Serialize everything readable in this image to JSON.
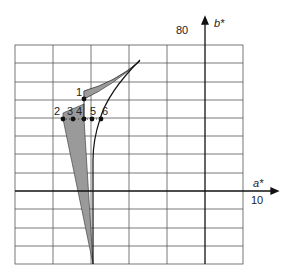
{
  "diagram": {
    "type": "CIELAB a*-b* chromaticity grid with shaded regions",
    "axes": {
      "x_label": "a*",
      "y_label": "b*",
      "x_tick_label": "10",
      "y_tick_label": "80"
    },
    "points": [
      {
        "id": "1",
        "label": "1"
      },
      {
        "id": "2",
        "label": "2"
      },
      {
        "id": "3",
        "label": "3"
      },
      {
        "id": "4",
        "label": "4"
      },
      {
        "id": "5",
        "label": "5"
      },
      {
        "id": "6",
        "label": "6"
      }
    ],
    "colors": {
      "grid": "#555555",
      "axis": "#111111",
      "shade": "#9a9a9a",
      "curve": "#111111"
    }
  }
}
